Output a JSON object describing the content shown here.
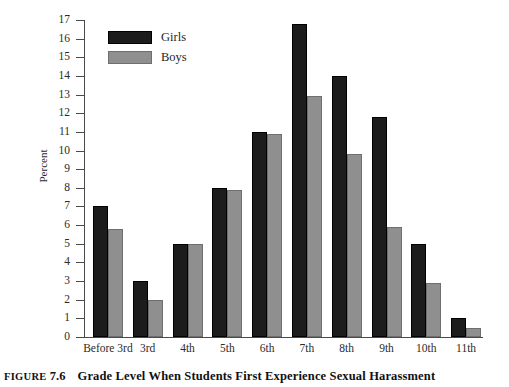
{
  "figure": {
    "caption_prefix": "FIGURE",
    "caption_number": "7.6",
    "caption_title": "Grade Level When Students First Experience Sexual Harassment"
  },
  "legend": {
    "position": "top-left-inside",
    "entries": [
      {
        "label": "Girls",
        "color": "#1c1c1c"
      },
      {
        "label": "Boys",
        "color": "#8f8f8f"
      }
    ]
  },
  "chart_data": {
    "type": "bar",
    "title": "Grade Level When Students First Experience Sexual Harassment",
    "xlabel": "",
    "ylabel": "Percent",
    "ylim": [
      0,
      17
    ],
    "ytick_labels": [
      "0",
      "1",
      "2",
      "3",
      "4",
      "5",
      "6",
      "7",
      "8",
      "9",
      "10",
      "11",
      "12",
      "13",
      "14",
      "15",
      "16",
      "17"
    ],
    "grid": false,
    "legend_position": "upper left",
    "categories": [
      "Before 3rd",
      "3rd",
      "4th",
      "5th",
      "6th",
      "7th",
      "8th",
      "9th",
      "10th",
      "11th"
    ],
    "series": [
      {
        "name": "Girls",
        "color": "#1c1c1c",
        "values": [
          7.0,
          3.0,
          5.0,
          8.0,
          11.0,
          16.8,
          14.0,
          11.8,
          5.0,
          1.0
        ]
      },
      {
        "name": "Boys",
        "color": "#8f8f8f",
        "values": [
          5.8,
          2.0,
          5.0,
          7.9,
          10.9,
          12.9,
          9.8,
          5.9,
          2.9,
          0.5
        ]
      }
    ]
  }
}
